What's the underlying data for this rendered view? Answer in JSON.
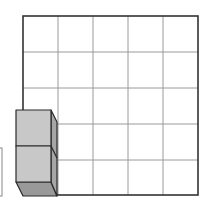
{
  "diagram": {
    "grid": {
      "rows": 5,
      "cols": 5,
      "x": 23,
      "y": 16,
      "width": 175,
      "height": 179
    },
    "cubes": {
      "count": 2,
      "stack_position": "bottom-left"
    },
    "colors": {
      "grid_line": "#9a9a9a",
      "border": "#333333",
      "cube_front": "#c8c8c8",
      "cube_side": "#a6a6a6",
      "cube_bottom": "#999999",
      "edge": "#2a2a2a"
    }
  }
}
